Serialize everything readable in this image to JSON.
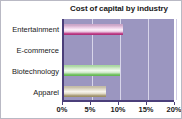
{
  "chart_data": {
    "type": "bar",
    "orientation": "horizontal",
    "title": "Cost of capital by industry",
    "xlabel": "",
    "ylabel": "",
    "categories": [
      "Entertainment",
      "E-commerce",
      "Biotechnology",
      "Apparel"
    ],
    "values": [
      10.5,
      18.3,
      10.0,
      7.5
    ],
    "value_unit": "%",
    "xlim": [
      0,
      20
    ],
    "xticks": [
      0,
      5,
      10,
      15,
      20
    ],
    "xtick_labels": [
      "0%",
      "5%",
      "10%",
      "15%",
      "20%"
    ],
    "grid": true,
    "legend": false,
    "series": [
      {
        "name": "Cost of capital",
        "values": [
          10.5,
          18.3,
          10.0,
          7.5
        ]
      }
    ],
    "bar_colors": [
      "#c0408a",
      "#f4783a",
      "#74c264",
      "#a99d79"
    ],
    "plot_background": "#9b96c0",
    "figure_background": "#ffffff",
    "gridline_color": "#d8d5ea",
    "axis_color": "#4b3f7a"
  }
}
